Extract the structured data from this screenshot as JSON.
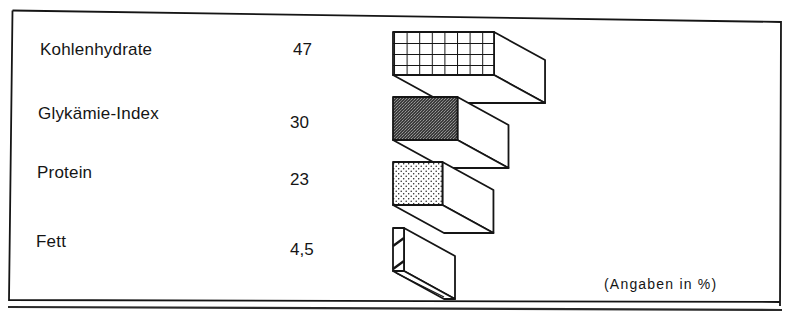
{
  "chart_data": {
    "type": "bar",
    "orientation": "horizontal-3d",
    "title": "",
    "categories": [
      "Kohlenhydrate",
      "Glykämie-Index",
      "Protein",
      "Fett"
    ],
    "values": [
      47,
      30,
      23,
      4.5
    ],
    "value_labels": [
      "47",
      "30",
      "23",
      "4,5"
    ],
    "patterns": [
      "grid",
      "dense-dark-stipple",
      "light-dots",
      "diagonal-hatch"
    ],
    "unit_note": "(Angaben in %)",
    "xlabel": "",
    "ylabel": "",
    "grid": false,
    "legend": "none"
  },
  "colors": {
    "ink": "#151515",
    "dark_fill": "#4a4a4a",
    "background": "#ffffff"
  }
}
